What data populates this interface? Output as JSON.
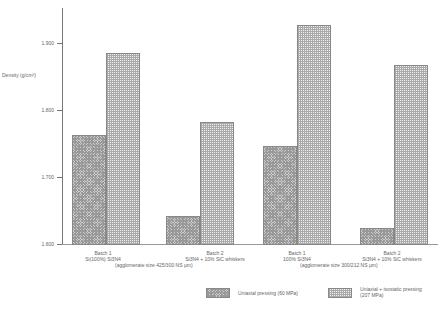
{
  "chart_data": {
    "type": "bar",
    "title": "",
    "ylabel": "Density (g/cm³)",
    "xlabel": "",
    "ylim": [
      1.6,
      1.95
    ],
    "yticks": [
      "1.600",
      "1.700",
      "1.800",
      "1.900"
    ],
    "categories": [
      {
        "line1": "Batch 1",
        "line2": "Si(100%) Si3N4"
      },
      {
        "line1": "Batch 2",
        "line2": "Si3N4 + 10% SiC whiskers"
      },
      {
        "line1": "Batch 1",
        "line2": "100% Si3N4"
      },
      {
        "line1": "Batch 2",
        "line2": "Si3N4 + 10% SiC whiskers"
      }
    ],
    "group_labels": [
      "(agglomerate size 425/300 NS µm)",
      "(agglomerate size 300/212 NS µm)"
    ],
    "series": [
      {
        "name": "Uniaxial pressing (60 MPa)",
        "values": [
          1.763,
          1.643,
          1.747,
          1.625
        ]
      },
      {
        "name": "Uniaxial + isostatic pressing (207 MPa)",
        "values": [
          1.885,
          1.783,
          1.927,
          1.867
        ]
      }
    ],
    "legend": {
      "position": "bottom-right",
      "items": [
        "Uniaxial pressing (60 MPa)",
        "Uniaxial + isostatic pressing",
        "(207 MPa)"
      ]
    },
    "grid": false
  }
}
